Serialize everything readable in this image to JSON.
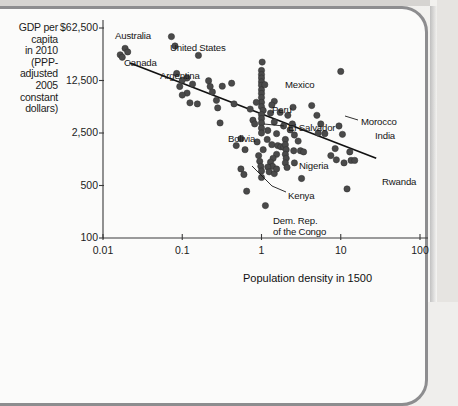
{
  "figure": {
    "y_axis_title": [
      "GDP per",
      "capita",
      "in 2010",
      "(PPP-",
      "adjusted",
      "2005",
      "constant",
      "dollars)"
    ],
    "x_axis_title": "Population density in 1500"
  },
  "chart_data": {
    "type": "scatter",
    "title": "",
    "xlabel": "Population density in 1500",
    "ylabel": "GDP per capita in 2010 (PPP-adjusted 2005 constant dollars)",
    "xscale": "log",
    "yscale": "log",
    "xlim": [
      0.01,
      100
    ],
    "ylim": [
      100,
      62500
    ],
    "xticks": [
      0.01,
      0.1,
      1,
      10,
      100
    ],
    "xticklabels": [
      "0.01",
      "0.1",
      "1",
      "10",
      "100"
    ],
    "yticks": [
      100,
      500,
      2500,
      12500,
      62500
    ],
    "yticklabels": [
      "100",
      "500",
      "2,500",
      "12,500",
      "$62,500"
    ],
    "grid": false,
    "legend": null,
    "trendline": {
      "type": "linear-fit-on-log-log",
      "x_start": 0.0215,
      "y_start": 21500,
      "x_end": 28.0,
      "y_end": 1150
    },
    "annotations": [
      {
        "label": "Australia",
        "x": 0.019,
        "y": 33000
      },
      {
        "label": "Canada",
        "x": 0.0155,
        "y": 27000
      },
      {
        "label": "United States",
        "x": 0.083,
        "y": 36000
      },
      {
        "label": "Argentina",
        "x": 0.105,
        "y": 14000
      },
      {
        "label": "Mexico",
        "x": 1.05,
        "y": 11000
      },
      {
        "label": "Peru",
        "x": 1.5,
        "y": 6600
      },
      {
        "label": "El Salvador",
        "x": 1.25,
        "y": 4900
      },
      {
        "label": "Bolivia",
        "x": 0.75,
        "y": 3700
      },
      {
        "label": "Morocco",
        "x": 6.0,
        "y": 4200
      },
      {
        "label": "India",
        "x": 10.0,
        "y": 3300
      },
      {
        "label": "Nigeria",
        "x": 1.9,
        "y": 1700
      },
      {
        "label": "Kenya",
        "x": 1.3,
        "y": 1100
      },
      {
        "label": "Rwanda",
        "x": 14.5,
        "y": 1050
      },
      {
        "label": "Dem. Rep. of the Congo",
        "x": 1.15,
        "y": 280
      }
    ],
    "points": [
      {
        "x": 0.019,
        "y": 33500
      },
      {
        "x": 0.0205,
        "y": 30000
      },
      {
        "x": 0.0165,
        "y": 27500
      },
      {
        "x": 0.0175,
        "y": 25500
      },
      {
        "x": 0.073,
        "y": 48000
      },
      {
        "x": 0.081,
        "y": 36000
      },
      {
        "x": 0.16,
        "y": 27000
      },
      {
        "x": 0.085,
        "y": 15500
      },
      {
        "x": 0.115,
        "y": 13500
      },
      {
        "x": 0.1,
        "y": 12600
      },
      {
        "x": 0.093,
        "y": 10400
      },
      {
        "x": 0.135,
        "y": 11200
      },
      {
        "x": 0.215,
        "y": 12400
      },
      {
        "x": 0.225,
        "y": 10400
      },
      {
        "x": 0.24,
        "y": 8800
      },
      {
        "x": 0.115,
        "y": 8500
      },
      {
        "x": 0.1,
        "y": 8000
      },
      {
        "x": 0.125,
        "y": 6300
      },
      {
        "x": 0.155,
        "y": 6100
      },
      {
        "x": 0.27,
        "y": 6800
      },
      {
        "x": 0.28,
        "y": 5400
      },
      {
        "x": 0.3,
        "y": 3400
      },
      {
        "x": 0.42,
        "y": 11500
      },
      {
        "x": 0.45,
        "y": 6100
      },
      {
        "x": 0.48,
        "y": 1700
      },
      {
        "x": 0.55,
        "y": 830
      },
      {
        "x": 0.62,
        "y": 1500
      },
      {
        "x": 0.6,
        "y": 700
      },
      {
        "x": 0.65,
        "y": 420
      },
      {
        "x": 0.78,
        "y": 3700
      },
      {
        "x": 0.82,
        "y": 3300
      },
      {
        "x": 0.72,
        "y": 5200
      },
      {
        "x": 0.88,
        "y": 1900
      },
      {
        "x": 0.92,
        "y": 1250
      },
      {
        "x": 0.95,
        "y": 1050
      },
      {
        "x": 0.98,
        "y": 900
      },
      {
        "x": 1.0,
        "y": 780
      },
      {
        "x": 1.0,
        "y": 640
      },
      {
        "x": 1.02,
        "y": 22000
      },
      {
        "x": 1.0,
        "y": 17000
      },
      {
        "x": 1.0,
        "y": 15000
      },
      {
        "x": 1.0,
        "y": 13500
      },
      {
        "x": 1.0,
        "y": 12000
      },
      {
        "x": 1.0,
        "y": 10800
      },
      {
        "x": 1.0,
        "y": 9400
      },
      {
        "x": 1.0,
        "y": 8400
      },
      {
        "x": 1.0,
        "y": 7400
      },
      {
        "x": 1.0,
        "y": 6400
      },
      {
        "x": 1.0,
        "y": 5600
      },
      {
        "x": 1.05,
        "y": 5000
      },
      {
        "x": 1.0,
        "y": 4400
      },
      {
        "x": 1.0,
        "y": 3900
      },
      {
        "x": 1.0,
        "y": 3400
      },
      {
        "x": 1.0,
        "y": 2900
      },
      {
        "x": 1.0,
        "y": 2500
      },
      {
        "x": 1.1,
        "y": 11000
      },
      {
        "x": 1.45,
        "y": 6600
      },
      {
        "x": 1.35,
        "y": 5900
      },
      {
        "x": 1.3,
        "y": 4600
      },
      {
        "x": 1.45,
        "y": 3500
      },
      {
        "x": 1.2,
        "y": 2700
      },
      {
        "x": 1.55,
        "y": 2450
      },
      {
        "x": 1.9,
        "y": 3100
      },
      {
        "x": 2.15,
        "y": 4300
      },
      {
        "x": 2.5,
        "y": 5500
      },
      {
        "x": 2.45,
        "y": 3300
      },
      {
        "x": 2.6,
        "y": 2350
      },
      {
        "x": 2.9,
        "y": 1950
      },
      {
        "x": 1.35,
        "y": 1750
      },
      {
        "x": 1.6,
        "y": 1700
      },
      {
        "x": 1.75,
        "y": 1640
      },
      {
        "x": 1.9,
        "y": 1620
      },
      {
        "x": 1.55,
        "y": 1300
      },
      {
        "x": 1.4,
        "y": 1150
      },
      {
        "x": 1.3,
        "y": 1020
      },
      {
        "x": 1.38,
        "y": 900
      },
      {
        "x": 1.2,
        "y": 880
      },
      {
        "x": 1.25,
        "y": 760
      },
      {
        "x": 1.45,
        "y": 720
      },
      {
        "x": 1.55,
        "y": 830
      },
      {
        "x": 2.0,
        "y": 2050
      },
      {
        "x": 2.0,
        "y": 1750
      },
      {
        "x": 2.05,
        "y": 1500
      },
      {
        "x": 2.0,
        "y": 1300
      },
      {
        "x": 2.05,
        "y": 1150
      },
      {
        "x": 2.0,
        "y": 1000
      },
      {
        "x": 2.1,
        "y": 870
      },
      {
        "x": 2.55,
        "y": 1450
      },
      {
        "x": 2.6,
        "y": 1000
      },
      {
        "x": 3.1,
        "y": 1450
      },
      {
        "x": 3.4,
        "y": 1400
      },
      {
        "x": 3.2,
        "y": 620
      },
      {
        "x": 4.3,
        "y": 5800
      },
      {
        "x": 5.0,
        "y": 4300
      },
      {
        "x": 5.6,
        "y": 3300
      },
      {
        "x": 5.2,
        "y": 2500
      },
      {
        "x": 6.3,
        "y": 2450
      },
      {
        "x": 7.5,
        "y": 1250
      },
      {
        "x": 9.5,
        "y": 3100
      },
      {
        "x": 10.5,
        "y": 2400
      },
      {
        "x": 8.5,
        "y": 1550
      },
      {
        "x": 8.8,
        "y": 1100
      },
      {
        "x": 11.0,
        "y": 1000
      },
      {
        "x": 13.5,
        "y": 1080
      },
      {
        "x": 15.0,
        "y": 1080
      },
      {
        "x": 13.0,
        "y": 1400
      },
      {
        "x": 10.0,
        "y": 16500
      },
      {
        "x": 12.0,
        "y": 450
      },
      {
        "x": 0.86,
        "y": 6400
      },
      {
        "x": 1.12,
        "y": 270
      },
      {
        "x": 0.32,
        "y": 10500
      },
      {
        "x": 0.55,
        "y": 2100
      },
      {
        "x": 1.72,
        "y": 4700
      },
      {
        "x": 2.3,
        "y": 2750
      },
      {
        "x": 1.18,
        "y": 2050
      },
      {
        "x": 1.05,
        "y": 1500
      }
    ]
  }
}
